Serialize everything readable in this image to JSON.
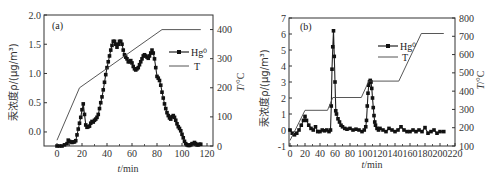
{
  "chart_data": [
    {
      "panel": "(a)",
      "type": "line",
      "xlabel": "t/min",
      "ylabel": "汞浓度ρ/(μg/m³)",
      "ylabel_right": "T/°C",
      "xlim": [
        -10,
        130
      ],
      "ylim": [
        -0.24,
        2.0
      ],
      "ylim_right": [
        0,
        450
      ],
      "xticks": [
        0,
        20,
        40,
        60,
        80,
        100,
        120
      ],
      "yticks": [
        "0.0",
        "0.5",
        "1.0",
        "1.5",
        "2.0"
      ],
      "yticks_right": [
        "0",
        "100",
        "200",
        "300",
        "400"
      ],
      "legend": [
        "Hg⁰",
        "T"
      ],
      "legend_position": "upper right",
      "series": [
        {
          "name": "Hg⁰",
          "axis": "left",
          "marker": "square",
          "x": [
            0,
            2,
            4,
            6,
            8,
            9,
            10,
            11,
            12,
            13,
            14,
            15,
            16,
            17,
            18,
            19,
            20,
            21,
            22,
            23,
            24,
            25,
            26,
            27,
            28,
            29,
            30,
            31,
            32,
            33,
            34,
            35,
            36,
            37,
            38,
            39,
            40,
            41,
            42,
            43,
            44,
            45,
            46,
            47,
            48,
            49,
            50,
            51,
            52,
            53,
            54,
            55,
            56,
            57,
            58,
            59,
            60,
            61,
            62,
            63,
            64,
            65,
            66,
            67,
            68,
            69,
            70,
            71,
            72,
            73,
            74,
            75,
            76,
            77,
            78,
            79,
            80,
            81,
            82,
            83,
            84,
            85,
            86,
            87,
            88,
            89,
            90,
            91,
            92,
            93,
            94,
            95,
            96,
            97,
            98,
            99,
            100,
            101,
            102,
            103,
            104,
            105,
            106,
            107,
            108,
            109,
            110,
            111,
            112,
            113,
            114,
            115
          ],
          "y": [
            -0.24,
            -0.24,
            -0.24,
            -0.22,
            -0.2,
            -0.14,
            -0.16,
            -0.17,
            -0.18,
            -0.17,
            -0.17,
            -0.15,
            -0.05,
            0.05,
            0.15,
            0.25,
            0.38,
            0.48,
            0.3,
            0.12,
            0.08,
            0.09,
            0.1,
            0.15,
            0.18,
            0.17,
            0.2,
            0.22,
            0.25,
            0.3,
            0.4,
            0.5,
            0.6,
            0.72,
            0.85,
            0.98,
            1.1,
            1.2,
            1.3,
            1.4,
            1.48,
            1.55,
            1.55,
            1.5,
            1.45,
            1.5,
            1.55,
            1.55,
            1.5,
            1.4,
            1.32,
            1.28,
            1.25,
            1.2,
            1.2,
            1.22,
            1.18,
            1.12,
            1.08,
            1.06,
            1.08,
            1.1,
            1.15,
            1.2,
            1.25,
            1.3,
            1.32,
            1.3,
            1.28,
            1.26,
            1.3,
            1.35,
            1.4,
            1.35,
            1.25,
            1.1,
            0.95,
            0.92,
            0.88,
            0.8,
            0.68,
            0.58,
            0.48,
            0.4,
            0.33,
            0.28,
            0.24,
            0.22,
            0.26,
            0.28,
            0.25,
            0.2,
            0.14,
            0.09,
            0.06,
            0.02,
            -0.04,
            -0.1,
            -0.16,
            -0.2,
            -0.22,
            -0.23,
            -0.23,
            -0.22,
            -0.2,
            -0.2,
            -0.18,
            -0.2,
            -0.22,
            -0.22,
            -0.21,
            -0.21
          ]
        },
        {
          "name": "T",
          "axis": "right",
          "marker": "none",
          "x": [
            0,
            18,
            84,
            115
          ],
          "y": [
            20,
            200,
            400,
            400
          ]
        }
      ]
    },
    {
      "panel": "(b)",
      "type": "line",
      "xlabel": "t/min",
      "ylabel": "汞浓度ρ/(μg/m³)",
      "ylabel_right": "T/°C",
      "xlim": [
        0,
        220
      ],
      "ylim": [
        -1,
        7
      ],
      "ylim_right": [
        100,
        800
      ],
      "xticks": [
        0,
        20,
        40,
        60,
        80,
        100,
        120,
        140,
        160,
        180,
        200,
        220
      ],
      "yticks": [
        "-1",
        "0",
        "1",
        "2",
        "3",
        "4",
        "5",
        "6",
        "7"
      ],
      "yticks_right": [
        "100",
        "200",
        "300",
        "400",
        "500",
        "600",
        "700",
        "800"
      ],
      "legend": [
        "Hg⁰",
        "T"
      ],
      "legend_position": "upper right",
      "series": [
        {
          "name": "Hg⁰",
          "axis": "left",
          "marker": "square",
          "x": [
            0,
            3,
            6,
            9,
            12,
            15,
            18,
            20,
            22,
            25,
            28,
            31,
            34,
            37,
            40,
            43,
            46,
            49,
            52,
            54,
            55,
            56,
            57,
            58,
            59,
            60,
            61,
            62,
            64,
            66,
            68,
            70,
            73,
            76,
            80,
            84,
            88,
            92,
            96,
            99,
            101,
            102,
            103,
            104,
            105,
            106,
            107,
            108,
            109,
            110,
            111,
            112,
            113,
            114,
            116,
            118,
            120,
            124,
            128,
            132,
            136,
            140,
            144,
            148,
            152,
            156,
            160,
            164,
            168,
            172,
            176,
            180,
            184,
            188,
            192,
            196,
            200,
            205
          ],
          "y": [
            0,
            -0.2,
            -0.3,
            -0.2,
            0,
            0.3,
            0.6,
            0.85,
            0.6,
            0.3,
            0.1,
            0,
            0.2,
            -0.1,
            -0.1,
            0,
            -0.05,
            0,
            -0.1,
            0,
            1.5,
            3.8,
            5.2,
            6.2,
            4.6,
            3,
            1.2,
            1,
            0.7,
            0.5,
            0.3,
            0.2,
            0.1,
            0.05,
            0.1,
            0,
            0.05,
            0,
            -0.1,
            0,
            0.2,
            0.6,
            1.5,
            2.3,
            2.8,
            3.0,
            3.1,
            3.0,
            2.6,
            2.0,
            1.4,
            0.9,
            0.5,
            0.3,
            0.1,
            0,
            0.1,
            0,
            -0.1,
            0.1,
            0,
            -0.1,
            0,
            0.2,
            0,
            -0.1,
            -0.1,
            0,
            -0.1,
            0,
            -0.1,
            0.15,
            -0.2,
            -0.1,
            0,
            -0.2,
            -0.1,
            -0.1
          ]
        },
        {
          "name": "T",
          "axis": "right",
          "marker": "none",
          "x": [
            0,
            20,
            50,
            57,
            95,
            105,
            145,
            175,
            205
          ],
          "y": [
            130,
            295,
            295,
            365,
            365,
            455,
            455,
            715,
            715
          ]
        }
      ]
    }
  ],
  "panels": {
    "a": {
      "label": "(a)",
      "xlabel": "t/min",
      "ylabel": "汞浓度ρ/(μg/m³)",
      "ylabel_right": "T/°C",
      "legend": {
        "hg": "Hg⁰",
        "t": "T"
      },
      "xticks": [
        "0",
        "20",
        "40",
        "60",
        "80",
        "100",
        "120"
      ],
      "yticks": [
        "0.0",
        "0.5",
        "1.0",
        "1.5",
        "2.0"
      ],
      "yticks_right": [
        "0",
        "100",
        "200",
        "300",
        "400"
      ]
    },
    "b": {
      "label": "(b)",
      "xlabel": "t/min",
      "ylabel": "汞浓度ρ/(μg/m³)",
      "ylabel_right": "T/°C",
      "legend": {
        "hg": "Hg⁰",
        "t": "T"
      },
      "xticks": [
        "0",
        "20",
        "40",
        "60",
        "80",
        "100",
        "120",
        "140",
        "160",
        "180",
        "200",
        "220"
      ],
      "yticks": [
        "-1",
        "0",
        "1",
        "2",
        "3",
        "4",
        "5",
        "6",
        "7"
      ],
      "yticks_right": [
        "100",
        "200",
        "300",
        "400",
        "500",
        "600",
        "700",
        "800"
      ]
    }
  },
  "colors": {
    "line": "#333333",
    "marker": "#1a1a1a",
    "axis": "#333333"
  }
}
